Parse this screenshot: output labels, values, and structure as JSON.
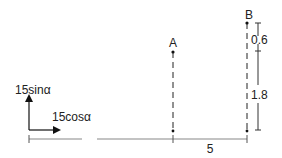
{
  "diagram": {
    "points": [
      {
        "label": "A"
      },
      {
        "label": "B"
      }
    ],
    "vectors": {
      "vertical_label": "15sinα",
      "horizontal_label": "15cosα"
    },
    "dimensions": {
      "horizontal_AB": "5",
      "upper_segment": "0.6",
      "lower_segment": "1.8"
    },
    "colors": {
      "line": "#222222",
      "baseline": "#777777"
    }
  }
}
